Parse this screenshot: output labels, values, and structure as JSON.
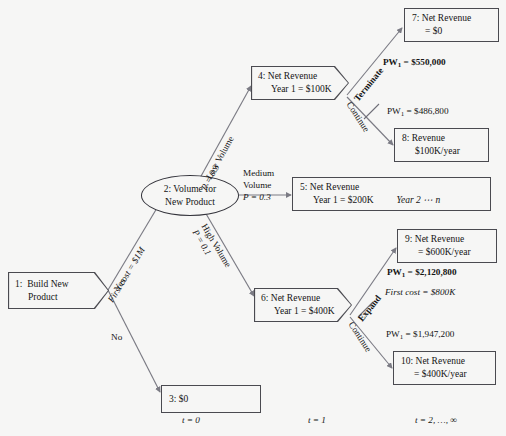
{
  "diagram": {
    "background": "#f6f6f5",
    "line_color": "#6f6f78"
  },
  "nodes": {
    "n1": {
      "id": "1:",
      "line1": "Build New",
      "line2": "Product",
      "shape": "pentagon"
    },
    "n2": {
      "line1": "2:  Volume for",
      "line2": "New Product",
      "shape": "ellipse"
    },
    "n3": {
      "line1": "3:  $0",
      "shape": "rectangle"
    },
    "n4": {
      "line1": "4:  Net Revenue",
      "line2": "Year 1  =  $100K",
      "shape": "pentagon"
    },
    "n5": {
      "line1": "5:  Net Revenue",
      "line2": "Year 1  =  $200K",
      "line2b": "Year 2 ⋯ n",
      "shape": "rectangle"
    },
    "n6": {
      "line1": "6:  Net Revenue",
      "line2": "Year 1  =  $400K",
      "shape": "pentagon"
    },
    "n7": {
      "line1": "7:  Net Revenue",
      "line2": "=  $0",
      "shape": "rectangle"
    },
    "n8": {
      "line1": "8:  Revenue",
      "line2": "$100K/year",
      "shape": "rectangle"
    },
    "n9": {
      "line1": "9:  Net Revenue",
      "line2": "=  $600K/year",
      "shape": "rectangle"
    },
    "n10": {
      "line1": "10:  Net Revenue",
      "line2": "=  $400K/year",
      "shape": "rectangle"
    }
  },
  "branch_labels": {
    "yes": "Yes",
    "first_cost_1m": "First cost  =  $1M",
    "no": "No",
    "low_volume": "Low Volume",
    "low_volume_p": "P  =  0.3",
    "medium_volume_l1": "Medium",
    "medium_volume_l2": "Volume",
    "medium_volume_p": "P  =  0.3",
    "high_volume": "High Volume",
    "high_volume_p": "P  =  0.1",
    "terminate": "Terminate",
    "continue_top": "Continue",
    "expand": "Expand",
    "continue_bottom": "Continue"
  },
  "values": {
    "pw_terminate": "=  $550,000",
    "pw_continue_top": "=  $486,800",
    "pw_expand": "=  $2,120,800",
    "first_cost_800k": "First cost  =  $800K",
    "pw_continue_bottom": "=  $1,947,200",
    "pw_prefix": "PW",
    "pw_sub": "1"
  },
  "timeline": {
    "t0": "t  =  0",
    "t1": "t  =  1",
    "t2": "t  =  2, …, ∞"
  }
}
